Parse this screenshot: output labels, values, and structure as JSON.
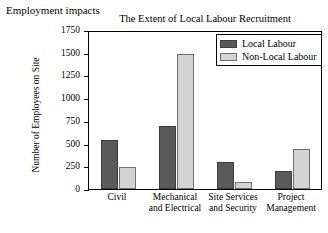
{
  "caption": "Employment impacts",
  "legend": {
    "position": "top-right",
    "entries": [
      {
        "label": "Local Labour",
        "color": "#5a5a5a",
        "swatch": "local-labour-swatch"
      },
      {
        "label": "Non-Local Labour",
        "color": "#d3d3d3",
        "swatch": "non-local-labour-swatch"
      }
    ]
  },
  "axis": {
    "yticks": [
      "1750",
      "1500",
      "1250",
      "1000",
      "750",
      "500",
      "250",
      "0"
    ]
  },
  "chart_data": {
    "type": "bar",
    "title": "The Extent of Local Labour Recruitment",
    "xlabel": "",
    "ylabel": "Number of Employees on Site",
    "categories": [
      "Civil",
      "Mechanical and Electrical",
      "Site Services and Security",
      "Project Management"
    ],
    "category_lines": [
      [
        "Civil"
      ],
      [
        "Mechanical",
        "and Electrical"
      ],
      [
        "Site Services",
        "and Security"
      ],
      [
        "Project",
        "Management"
      ]
    ],
    "series": [
      {
        "name": "Local Labour",
        "color": "#5a5a5a",
        "values": [
          550,
          700,
          300,
          200
        ]
      },
      {
        "name": "Non-Local Labour",
        "color": "#d3d3d3",
        "values": [
          250,
          1500,
          75,
          450
        ]
      }
    ],
    "ylim": [
      0,
      1750
    ],
    "ytick_step": 250,
    "grid": false,
    "legend_position": "top-right"
  }
}
